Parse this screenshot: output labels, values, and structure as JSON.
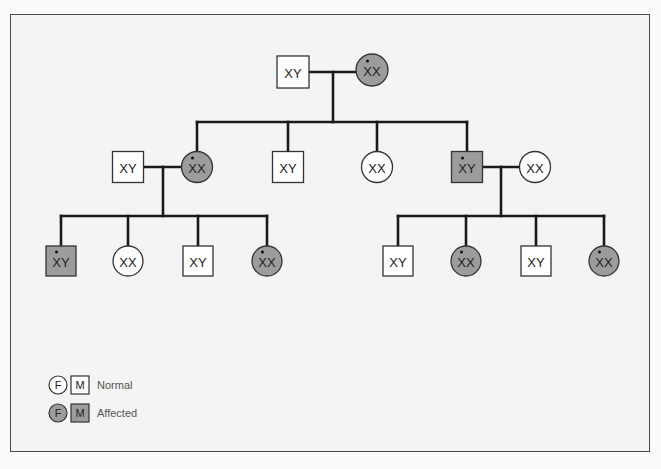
{
  "colors": {
    "line": "#1a1a1a",
    "normal_fill": "#ffffff",
    "affected_fill": "#9c9c9c",
    "outline": "#333333",
    "background": "#f4f4f4"
  },
  "generations": [
    {
      "name": "generation-1",
      "individuals": [
        {
          "id": "g1-father",
          "sex": "male",
          "label": "XY",
          "carrier_dot": false,
          "affected": false,
          "cx": 293,
          "cy": 72
        },
        {
          "id": "g1-mother",
          "sex": "female",
          "label": "XX",
          "carrier_dot": true,
          "affected": true,
          "cx": 372,
          "cy": 70
        }
      ]
    },
    {
      "name": "generation-2",
      "individuals": [
        {
          "id": "g2-spouse-left",
          "sex": "male",
          "label": "XY",
          "carrier_dot": false,
          "affected": false,
          "cx": 128,
          "cy": 167
        },
        {
          "id": "g2-daughter-1",
          "sex": "female",
          "label": "XX",
          "carrier_dot": true,
          "affected": true,
          "cx": 197,
          "cy": 167
        },
        {
          "id": "g2-son-1",
          "sex": "male",
          "label": "XY",
          "carrier_dot": false,
          "affected": false,
          "cx": 288,
          "cy": 167
        },
        {
          "id": "g2-daughter-2",
          "sex": "female",
          "label": "XX",
          "carrier_dot": false,
          "affected": false,
          "cx": 377,
          "cy": 167
        },
        {
          "id": "g2-son-2",
          "sex": "male",
          "label": "XY",
          "carrier_dot": true,
          "affected": true,
          "cx": 467,
          "cy": 167
        },
        {
          "id": "g2-spouse-right",
          "sex": "female",
          "label": "XX",
          "carrier_dot": false,
          "affected": false,
          "cx": 535,
          "cy": 167
        }
      ]
    },
    {
      "name": "generation-3",
      "individuals": [
        {
          "id": "g3-left-1",
          "sex": "male",
          "label": "XY",
          "carrier_dot": true,
          "affected": true,
          "cx": 61,
          "cy": 261
        },
        {
          "id": "g3-left-2",
          "sex": "female",
          "label": "XX",
          "carrier_dot": false,
          "affected": false,
          "cx": 128,
          "cy": 261
        },
        {
          "id": "g3-left-3",
          "sex": "male",
          "label": "XY",
          "carrier_dot": false,
          "affected": false,
          "cx": 198,
          "cy": 261
        },
        {
          "id": "g3-left-4",
          "sex": "female",
          "label": "XX",
          "carrier_dot": true,
          "affected": true,
          "cx": 267,
          "cy": 261
        },
        {
          "id": "g3-right-1",
          "sex": "male",
          "label": "XY",
          "carrier_dot": false,
          "affected": false,
          "cx": 398,
          "cy": 261
        },
        {
          "id": "g3-right-2",
          "sex": "female",
          "label": "XX",
          "carrier_dot": true,
          "affected": true,
          "cx": 466,
          "cy": 261
        },
        {
          "id": "g3-right-3",
          "sex": "male",
          "label": "XY",
          "carrier_dot": false,
          "affected": false,
          "cx": 536,
          "cy": 261
        },
        {
          "id": "g3-right-4",
          "sex": "female",
          "label": "XX",
          "carrier_dot": true,
          "affected": true,
          "cx": 604,
          "cy": 261
        }
      ]
    }
  ],
  "legend": {
    "normal": {
      "female_symbol": "F",
      "male_symbol": "M",
      "label": "Normal"
    },
    "affected": {
      "female_symbol": "F",
      "male_symbol": "M",
      "label": "Affected"
    }
  }
}
